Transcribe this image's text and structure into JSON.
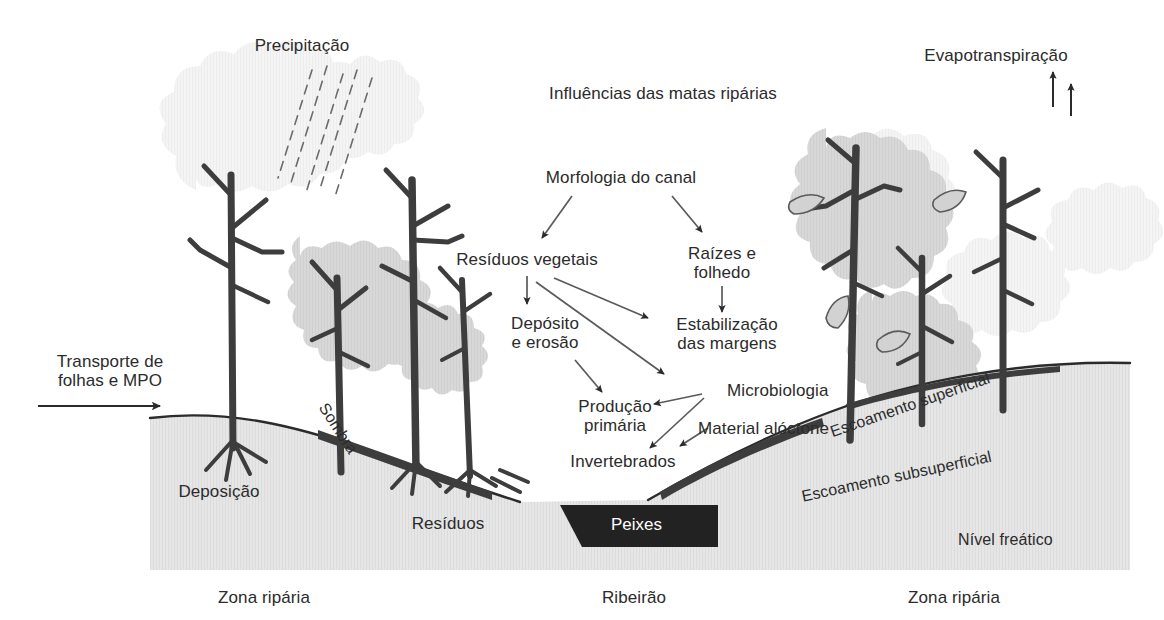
{
  "diagram": {
    "title": "Influências das matas ripárias",
    "type": "riparian-forest-cross-section",
    "colors": {
      "ink": "#2b2b2b",
      "trunk": "#3d3d3d",
      "ground": "#e3e3e3",
      "ground_edge": "#2b2b2b",
      "canopy_light": "#f2f2f2",
      "canopy_mid": "#d6d6d6",
      "fish_box": "#222222",
      "fish_text": "#ffffff",
      "background": "#ffffff"
    },
    "flow_labels": {
      "morfologia": "Morfologia do canal",
      "residuos_vegetais": "Resíduos vegetais",
      "raizes_folhedo": "Raízes e\nfolhedo",
      "deposito_erosao": "Depósito\ne erosão",
      "estabilizacao": "Estabilização\ndas margens",
      "producao_primaria": "Produção\nprimária",
      "microbiologia": "Microbiologia",
      "material_aloctone": "Material alóctone",
      "invertebrados": "Invertebrados"
    },
    "scene_labels": {
      "precipitacao": "Precipitação",
      "evapotranspiracao": "Evapotranspiração",
      "transporte": "Transporte de\nfolhas e MPO",
      "deposicao": "Deposição",
      "sombra": "Sombra",
      "residuos": "Resíduos",
      "peixes": "Peixes",
      "escoamento_superficial": "Escoamento superficial",
      "escoamento_subsuperficial": "Escoamento subsuperficial",
      "nivel_freatico": "Nível freático",
      "zona_riparia_esq": "Zona ripária",
      "ribeirao": "Ribeirão",
      "zona_riparia_dir": "Zona ripária"
    },
    "arrows": [
      {
        "name": "morfologia-to-residuos-vegetais",
        "from": "Morfologia do canal",
        "to": "Resíduos vegetais"
      },
      {
        "name": "morfologia-to-raizes",
        "from": "Morfologia do canal",
        "to": "Raízes e folhedo"
      },
      {
        "name": "residuos-vegetais-to-deposito",
        "from": "Resíduos vegetais",
        "to": "Depósito e erosão"
      },
      {
        "name": "residuos-vegetais-to-estabilizacao",
        "from": "Resíduos vegetais",
        "to": "Estabilização das margens"
      },
      {
        "name": "residuos-vegetais-to-microbiologia",
        "from": "Resíduos vegetais",
        "to": "Microbiologia"
      },
      {
        "name": "raizes-to-estabilizacao",
        "from": "Raízes e folhedo",
        "to": "Estabilização das margens"
      },
      {
        "name": "deposito-to-producao",
        "from": "Depósito e erosão",
        "to": "Produção primária"
      },
      {
        "name": "microbiologia-to-producao",
        "from": "Microbiologia",
        "to": "Produção primária"
      },
      {
        "name": "microbiologia-to-invertebrados",
        "from": "Microbiologia",
        "to": "Invertebrados"
      },
      {
        "name": "material-aloctone-to-invertebrados",
        "from": "Material alóctone",
        "to": "Invertebrados"
      },
      {
        "name": "transporte-inflow",
        "from": "Transporte de folhas e MPO",
        "to": "Zona ripária"
      },
      {
        "name": "evapotranspiracao-up-1",
        "from": "dossel",
        "to": "atmosfera"
      },
      {
        "name": "evapotranspiracao-up-2",
        "from": "dossel",
        "to": "atmosfera"
      }
    ]
  }
}
